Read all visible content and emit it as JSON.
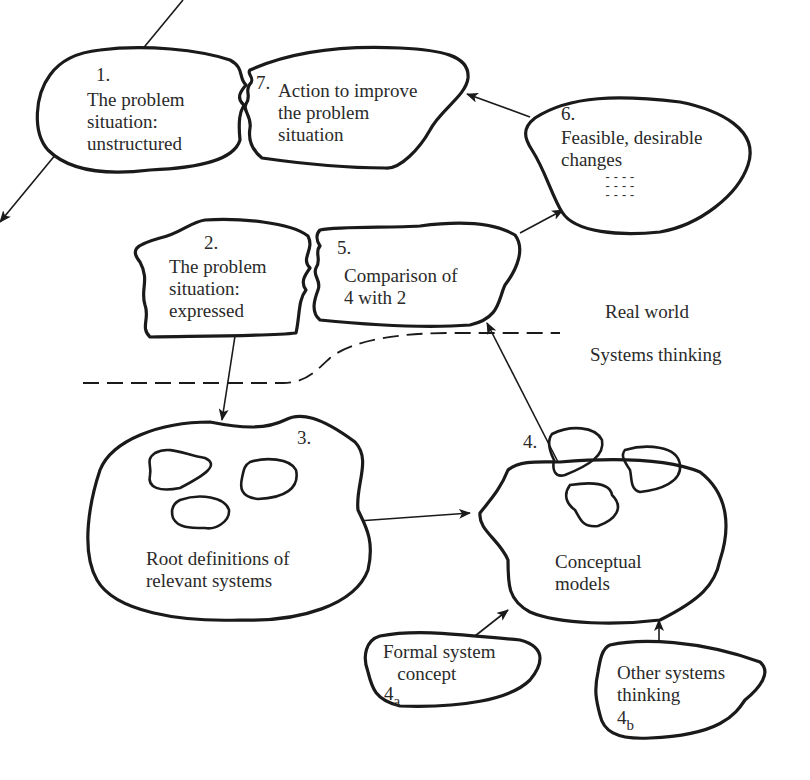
{
  "boundary": {
    "upper_label": "Real world",
    "lower_label": "Systems thinking"
  },
  "stages": [
    {
      "id": "1",
      "number": "1.",
      "text": "The problem\nsituation:\nunstructured"
    },
    {
      "id": "2",
      "number": "2.",
      "text": "The problem\nsituation:\nexpressed"
    },
    {
      "id": "3",
      "number": "3.",
      "text": "Root definitions of\nrelevant systems"
    },
    {
      "id": "4",
      "number": "4.",
      "text": "Conceptual\nmodels"
    },
    {
      "id": "4a",
      "number": "4",
      "subscript": "a",
      "text": "Formal system\n   concept"
    },
    {
      "id": "4b",
      "number": "4",
      "subscript": "b",
      "text": "Other systems\nthinking"
    },
    {
      "id": "5",
      "number": "5.",
      "text": "Comparison of\n4 with 2"
    },
    {
      "id": "6",
      "number": "6.",
      "text": "Feasible, desirable\nchanges",
      "list_marks": "----\n----\n----"
    },
    {
      "id": "7",
      "number": "7.",
      "text": "Action to improve\nthe problem\nsituation"
    }
  ],
  "edges": [
    {
      "from": "1",
      "to": "2"
    },
    {
      "from": "2",
      "to": "3"
    },
    {
      "from": "3",
      "to": "4"
    },
    {
      "from": "4a",
      "to": "4"
    },
    {
      "from": "4b",
      "to": "4"
    },
    {
      "from": "4",
      "to": "5"
    },
    {
      "from": "5",
      "to": "6"
    },
    {
      "from": "6",
      "to": "7"
    }
  ],
  "colors": {
    "ink": "#1a1a1a",
    "background": "#ffffff"
  }
}
